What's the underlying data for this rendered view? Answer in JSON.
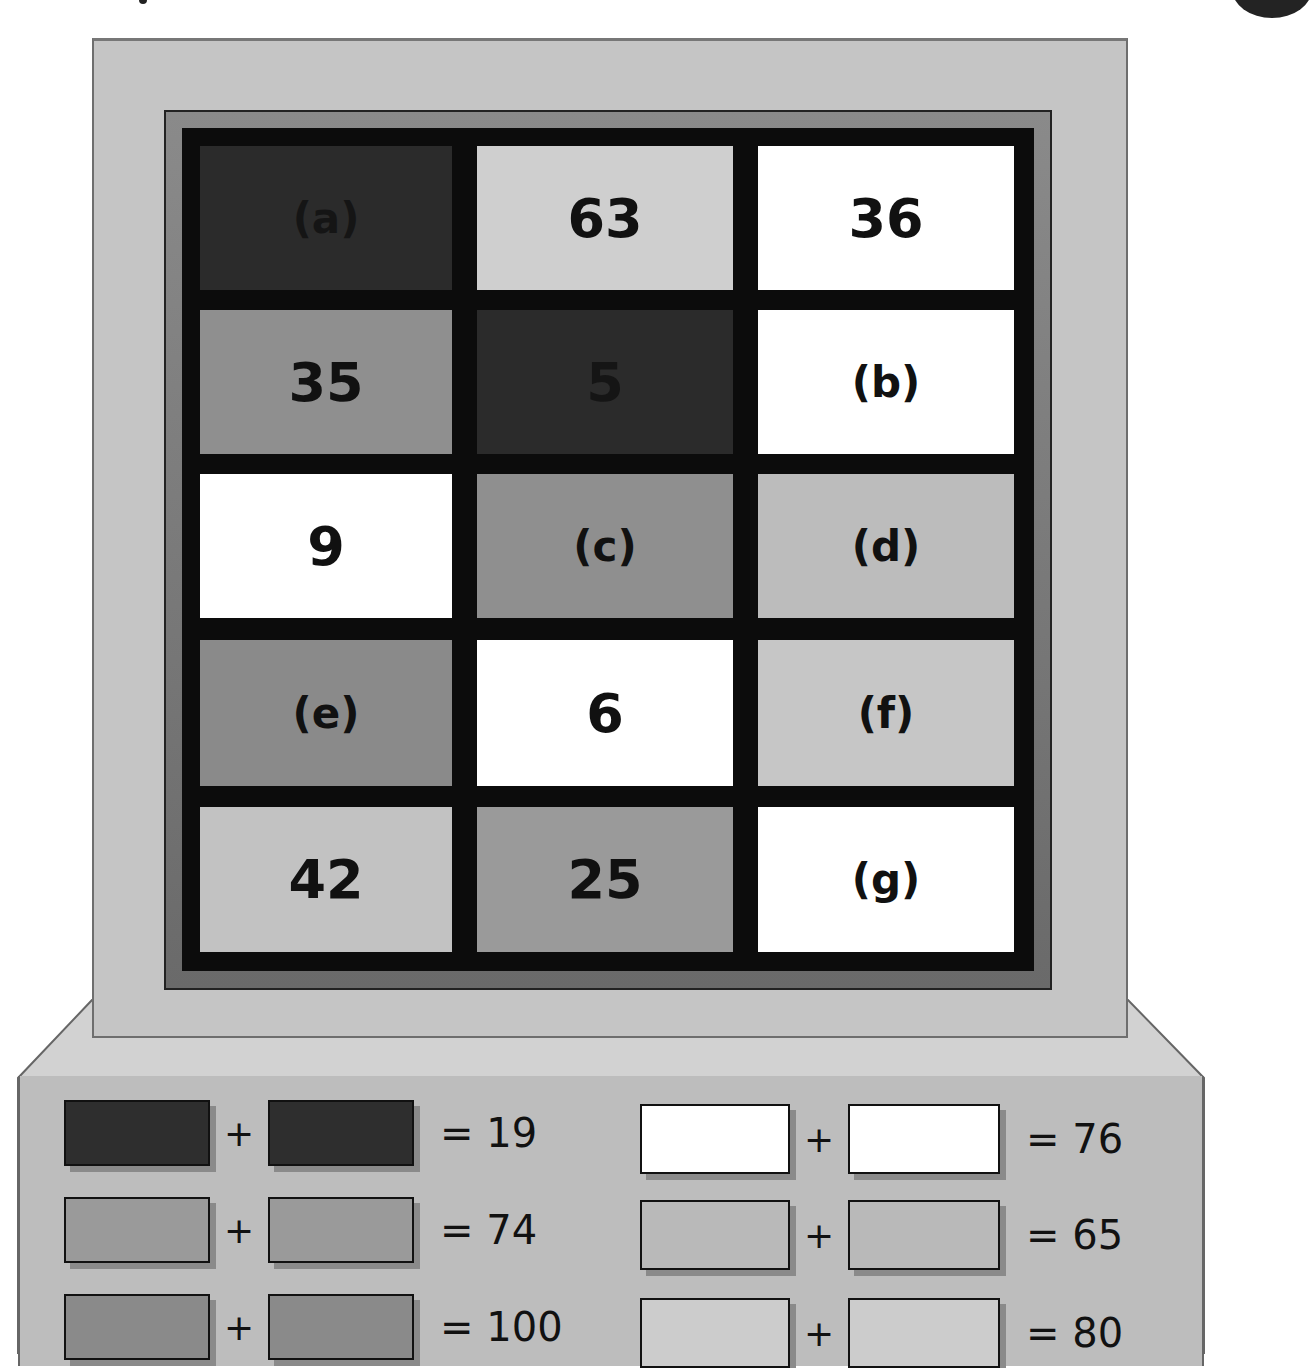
{
  "puzzle": {
    "grid": {
      "rows": [
        [
          {
            "text": "(a)",
            "color": "#2b2b2b",
            "type": "label"
          },
          {
            "text": "63",
            "color": "#cfcfcf",
            "type": "number"
          },
          {
            "text": "36",
            "color": "#ffffff",
            "type": "number"
          }
        ],
        [
          {
            "text": "35",
            "color": "#8f8f8f",
            "type": "number"
          },
          {
            "text": "5",
            "color": "#2b2b2b",
            "type": "number"
          },
          {
            "text": "(b)",
            "color": "#ffffff",
            "type": "label"
          }
        ],
        [
          {
            "text": "9",
            "color": "#ffffff",
            "type": "number"
          },
          {
            "text": "(c)",
            "color": "#8f8f8f",
            "type": "label"
          },
          {
            "text": "(d)",
            "color": "#bcbcbc",
            "type": "label"
          }
        ],
        [
          {
            "text": "(e)",
            "color": "#8a8a8a",
            "type": "label"
          },
          {
            "text": "6",
            "color": "#ffffff",
            "type": "number"
          },
          {
            "text": "(f)",
            "color": "#c6c6c6",
            "type": "label"
          }
        ],
        [
          {
            "text": "42",
            "color": "#c2c2c2",
            "type": "number"
          },
          {
            "text": "25",
            "color": "#9a9a9a",
            "type": "number"
          },
          {
            "text": "(g)",
            "color": "#ffffff",
            "type": "label"
          }
        ]
      ]
    },
    "equations": [
      {
        "color": "#2e2e2e",
        "plus": "+",
        "result": "= 19"
      },
      {
        "color": "#9a9a9a",
        "plus": "+",
        "result": "= 74"
      },
      {
        "color": "#8a8a8a",
        "plus": "+",
        "result": "= 100"
      },
      {
        "color": "#ffffff",
        "plus": "+",
        "result": "= 76"
      },
      {
        "color": "#b9b9b9",
        "plus": "+",
        "result": "= 65"
      },
      {
        "color": "#cccccc",
        "plus": "+",
        "result": "= 80"
      }
    ]
  }
}
